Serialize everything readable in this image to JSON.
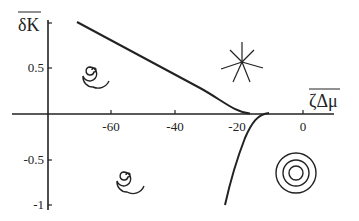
{
  "figure": {
    "type": "phase diagram",
    "y_axis": {
      "title": "δK",
      "title_overline": true,
      "ticks": [
        "0.5",
        "-0.5",
        "-1"
      ],
      "tick_values": [
        1,
        0.5,
        0,
        -0.5,
        -1
      ]
    },
    "x_axis": {
      "title": "ζΔμ",
      "title_overline": true,
      "ticks": [
        "-60",
        "-40",
        "-20",
        "0"
      ],
      "tick_values": [
        -60,
        -40,
        -20,
        0
      ]
    },
    "curves": [
      {
        "name": "upper-boundary",
        "description": "line from upper left descending to meet x-axis near -18"
      },
      {
        "name": "lower-boundary",
        "description": "curve from x-axis near -14 descending steeply to ~(-24,-1)"
      }
    ],
    "regions": [
      {
        "name": "upper-left",
        "symbol": "spiral",
        "meaning": "spiral / focus"
      },
      {
        "name": "lower-left",
        "symbol": "spiral",
        "meaning": "spiral / focus"
      },
      {
        "name": "upper-right",
        "symbol": "star",
        "meaning": "star node"
      },
      {
        "name": "lower-right",
        "symbol": "concentric-circles",
        "meaning": "center"
      }
    ],
    "colors": {
      "ink": "#222222",
      "background": "#ffffff"
    }
  }
}
